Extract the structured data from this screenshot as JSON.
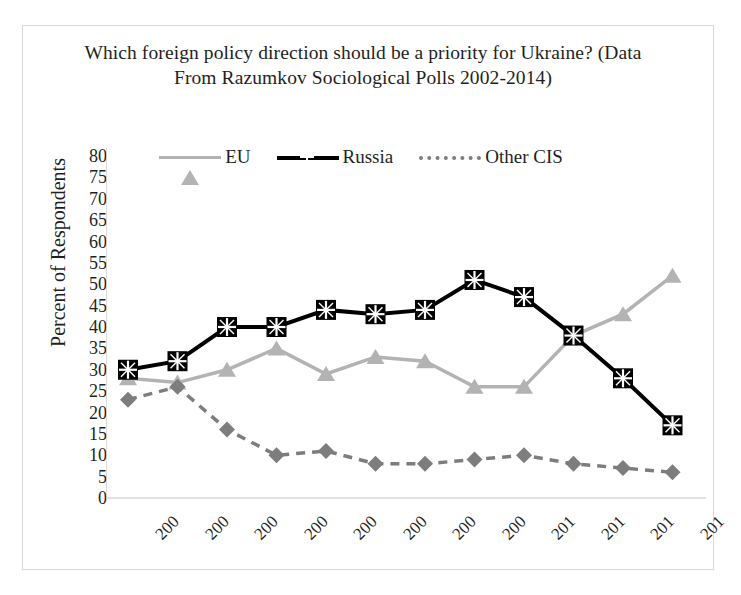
{
  "chart_data": {
    "type": "line",
    "title": "Which foreign policy direction should be a priority for Ukraine? (Data From Razumkov Sociological Polls 2002-2014)",
    "xlabel": "",
    "ylabel": "Percent of Respondents",
    "ylim": [
      0,
      80
    ],
    "ytick_step": 5,
    "yticks": [
      80,
      75,
      70,
      65,
      60,
      55,
      50,
      45,
      40,
      35,
      30,
      25,
      20,
      15,
      10,
      5,
      0
    ],
    "grid": false,
    "legend_position": "top-center",
    "categories": [
      "200",
      "200",
      "200",
      "200",
      "200",
      "200",
      "200",
      "200",
      "201",
      "201",
      "201",
      "201"
    ],
    "series": [
      {
        "name": "EU",
        "color": "#b3b3b3",
        "marker": "triangle",
        "linestyle": "solid",
        "values": [
          28,
          27,
          30,
          35,
          29,
          33,
          32,
          26,
          26,
          38,
          43,
          52
        ]
      },
      {
        "name": "Russia",
        "color": "#000000",
        "marker": "square-x",
        "linestyle": "solid",
        "values": [
          30,
          32,
          40,
          40,
          44,
          43,
          44,
          51,
          47,
          38,
          28,
          17
        ]
      },
      {
        "name": "Other CIS",
        "color": "#7d7d7d",
        "marker": "diamond",
        "linestyle": "dashed",
        "values": [
          23,
          26,
          16,
          10,
          11,
          8,
          8,
          9,
          10,
          8,
          7,
          6
        ]
      }
    ]
  },
  "legend": {
    "items": [
      {
        "label": "EU"
      },
      {
        "label": "Russia"
      },
      {
        "label": "Other CIS"
      }
    ]
  }
}
